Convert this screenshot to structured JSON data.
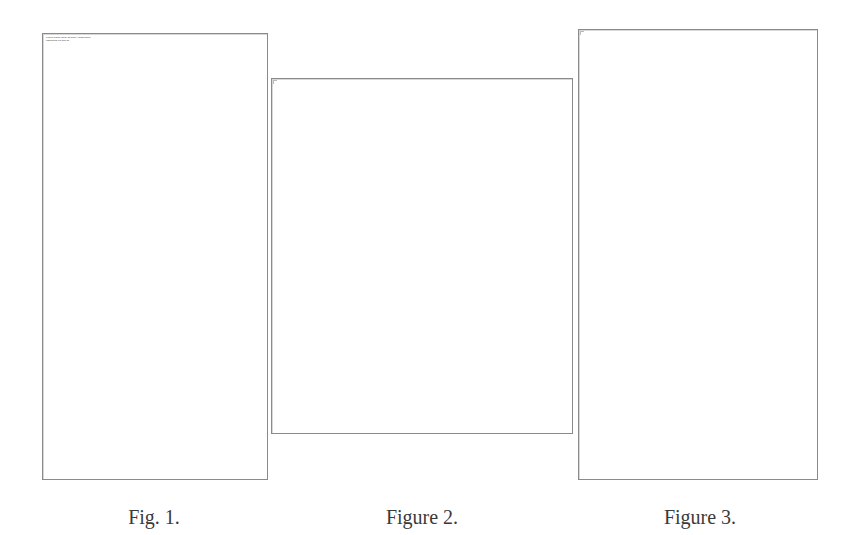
{
  "figures": [
    {
      "caption": "Fig. 1.",
      "header_lines": [
        "Lorem ipsum dolor sit amet, consectetur",
        "adipiscing elit sed do"
      ]
    },
    {
      "caption": "Figure 2."
    },
    {
      "caption": "Figure 3."
    }
  ],
  "colors": {
    "frame_border": "#8a8a8a",
    "caption_text": "#3a3a3a",
    "background": "#ffffff"
  }
}
